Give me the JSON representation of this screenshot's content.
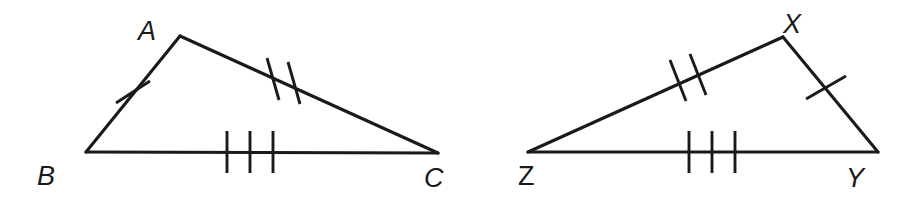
{
  "figure": {
    "width": 906,
    "height": 207,
    "background_color": "#ffffff",
    "stroke_color": "#1a1a1a"
  },
  "triangles": [
    {
      "name": "triangle-abc",
      "vertices": [
        {
          "label": "A",
          "x": 180,
          "y": 36,
          "label_x": 138,
          "label_y": 40,
          "italic": true
        },
        {
          "label": "B",
          "x": 86,
          "y": 152,
          "label_x": 37,
          "label_y": 185,
          "italic": true
        },
        {
          "label": "C",
          "x": 438,
          "y": 153,
          "label_x": 424,
          "label_y": 187,
          "italic": true
        }
      ],
      "sides": [
        {
          "name": "side-ab",
          "from": "B",
          "to": "A",
          "ticks": 1
        },
        {
          "name": "side-ac",
          "from": "A",
          "to": "C",
          "ticks": 2
        },
        {
          "name": "side-bc",
          "from": "B",
          "to": "C",
          "ticks": 3
        }
      ]
    },
    {
      "name": "triangle-xyz",
      "vertices": [
        {
          "label": "X",
          "x": 783,
          "y": 37,
          "label_x": 783,
          "label_y": 33,
          "italic": true
        },
        {
          "label": "Y",
          "x": 878,
          "y": 152,
          "label_x": 846,
          "label_y": 187,
          "italic": true
        },
        {
          "label": "Z",
          "x": 528,
          "y": 152,
          "label_x": 518,
          "label_y": 185,
          "italic": false
        }
      ],
      "sides": [
        {
          "name": "side-xy",
          "from": "X",
          "to": "Y",
          "ticks": 1
        },
        {
          "name": "side-zx",
          "from": "Z",
          "to": "X",
          "ticks": 2
        },
        {
          "name": "side-zy",
          "from": "Z",
          "to": "Y",
          "ticks": 3
        }
      ]
    }
  ],
  "geometry": {
    "triangle_abc": {
      "edges": [
        {
          "name": "edge-ba",
          "x1": 86,
          "y1": 152,
          "x2": 180,
          "y2": 36
        },
        {
          "name": "edge-ac",
          "x1": 180,
          "y1": 36,
          "x2": 438,
          "y2": 153
        },
        {
          "name": "edge-bc",
          "x1": 86,
          "y1": 152,
          "x2": 438,
          "y2": 153
        }
      ],
      "tick_marks": [
        {
          "name": "tick-ab-1",
          "x1": 116,
          "y1": 103,
          "x2": 150,
          "y2": 81
        },
        {
          "name": "tick-ac-1",
          "x1": 267,
          "y1": 58,
          "x2": 279,
          "y2": 100
        },
        {
          "name": "tick-ac-2",
          "x1": 288,
          "y1": 62,
          "x2": 300,
          "y2": 104
        },
        {
          "name": "tick-bc-1",
          "x1": 227,
          "y1": 131,
          "x2": 227,
          "y2": 173
        },
        {
          "name": "tick-bc-2",
          "x1": 250,
          "y1": 131,
          "x2": 250,
          "y2": 173
        },
        {
          "name": "tick-bc-3",
          "x1": 273,
          "y1": 131,
          "x2": 273,
          "y2": 173
        }
      ]
    },
    "triangle_xyz": {
      "edges": [
        {
          "name": "edge-zx",
          "x1": 528,
          "y1": 152,
          "x2": 783,
          "y2": 37
        },
        {
          "name": "edge-xy",
          "x1": 783,
          "y1": 37,
          "x2": 878,
          "y2": 152
        },
        {
          "name": "edge-zy",
          "x1": 528,
          "y1": 152,
          "x2": 878,
          "y2": 152
        }
      ],
      "tick_marks": [
        {
          "name": "tick-zx-1",
          "x1": 670,
          "y1": 60,
          "x2": 686,
          "y2": 101
        },
        {
          "name": "tick-zx-2",
          "x1": 690,
          "y1": 54,
          "x2": 706,
          "y2": 95
        },
        {
          "name": "tick-xy-1",
          "x1": 806,
          "y1": 99,
          "x2": 846,
          "y2": 76
        },
        {
          "name": "tick-zy-1",
          "x1": 689,
          "y1": 131,
          "x2": 689,
          "y2": 173
        },
        {
          "name": "tick-zy-2",
          "x1": 712,
          "y1": 131,
          "x2": 712,
          "y2": 173
        },
        {
          "name": "tick-zy-3",
          "x1": 735,
          "y1": 131,
          "x2": 735,
          "y2": 173
        }
      ]
    }
  }
}
